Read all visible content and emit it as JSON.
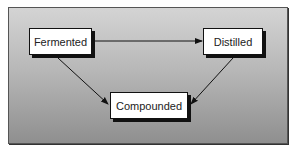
{
  "diagram": {
    "nodes": [
      {
        "id": "fermented",
        "label": "Fermented"
      },
      {
        "id": "distilled",
        "label": "Distilled"
      },
      {
        "id": "compounded",
        "label": "Compounded"
      }
    ],
    "edges": [
      {
        "from": "fermented",
        "to": "distilled"
      },
      {
        "from": "fermented",
        "to": "compounded"
      },
      {
        "from": "distilled",
        "to": "compounded"
      }
    ],
    "colors": {
      "background_top": "#d4d4d4",
      "background_bottom": "#8f8f8f",
      "node_fill": "#ffffff",
      "line": "#111111"
    }
  }
}
